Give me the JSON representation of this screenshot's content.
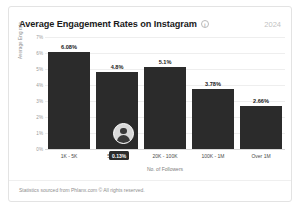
{
  "card": {
    "title": "Average Engagement Rates on Instagram",
    "info_icon": "info-icon",
    "year": "2024",
    "footer": "Statistics sourced from Phlanx.com © All rights reserved."
  },
  "overlay": {
    "tooltip_value": "0.13%",
    "marker_icon": "avatar-icon"
  },
  "colors": {
    "bar": "#2b2b2b",
    "grid": "#eeeeee",
    "text": "#1b1b1b",
    "muted": "#9a9a9a",
    "tooltip_bg": "#2b2b2b"
  },
  "chart_data": {
    "type": "bar",
    "title": "Average Engagement Rates on Instagram",
    "subtitle": "2024",
    "xlabel": "No. of Followers",
    "ylabel": "Average Eng rate",
    "categories": [
      "1K - 5K",
      "5K - 20K",
      "20K - 100K",
      "100K - 1M",
      "Over 1M"
    ],
    "values": [
      6.08,
      4.8,
      5.1,
      3.78,
      2.66
    ],
    "value_labels": [
      "6.08%",
      "4.8%",
      "5.1%",
      "3.78%",
      "2.66%"
    ],
    "ylim": [
      0,
      7
    ],
    "yticks": [
      0,
      1,
      2,
      3,
      4,
      5,
      6,
      7
    ],
    "ytick_labels": [
      "0%",
      "1%",
      "2%",
      "3%",
      "4%",
      "5%",
      "6%",
      "7%"
    ],
    "grid": true,
    "legend": "none"
  }
}
